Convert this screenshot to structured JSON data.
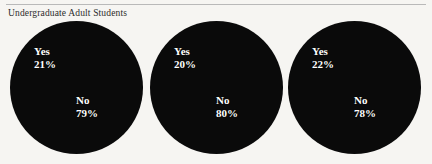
{
  "figure": {
    "title": "Undergraduate Adult Students",
    "background_color": "#f6f5f2",
    "rule_color": "#b9b9b9",
    "slice_color": "#0a0a0a",
    "label_color": "#ffffff"
  },
  "chart_data": {
    "type": "pie",
    "title": "Undergraduate Adult Students",
    "xlabel": "",
    "ylabel": "",
    "legend_position": "none",
    "grid": false,
    "labels": [
      "Yes",
      "No"
    ],
    "charts": [
      {
        "index": 1,
        "yes_label": "Yes",
        "yes_value": "21%",
        "no_label": "No",
        "no_value": "79%",
        "values": [
          21,
          79
        ]
      },
      {
        "index": 2,
        "yes_label": "Yes",
        "yes_value": "20%",
        "no_label": "No",
        "no_value": "80%",
        "values": [
          20,
          80
        ]
      },
      {
        "index": 3,
        "yes_label": "Yes",
        "yes_value": "22%",
        "no_label": "No",
        "no_value": "78%",
        "values": [
          22,
          78
        ]
      }
    ]
  }
}
